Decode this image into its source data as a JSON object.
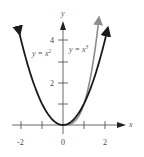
{
  "chart_data": {
    "type": "line",
    "title": "",
    "xlabel": "x",
    "ylabel": "y",
    "xlim": [
      -2.3,
      2.6
    ],
    "ylim": [
      -0.3,
      5.2
    ],
    "x_ticks": [
      -2,
      -1,
      0,
      1,
      2
    ],
    "x_tick_labels": [
      "-2",
      "0",
      "2"
    ],
    "y_ticks": [
      1,
      2,
      3,
      4
    ],
    "y_tick_labels": [
      "2",
      "4"
    ],
    "grid": false,
    "series": [
      {
        "name": "y = x²",
        "label": "y = x",
        "sup": "2",
        "color": "#1a1a1a",
        "function": "x^2",
        "domain": [
          -2.1,
          2.1
        ]
      },
      {
        "name": "y = x³",
        "label": "y = x",
        "sup": "3",
        "color": "#8c8c8c",
        "function": "x^3",
        "domain": [
          0,
          1.7
        ]
      }
    ]
  },
  "colors": {
    "axis": "#333333",
    "curve_x2": "#1a1a1a",
    "curve_x3": "#8c8c8c"
  }
}
